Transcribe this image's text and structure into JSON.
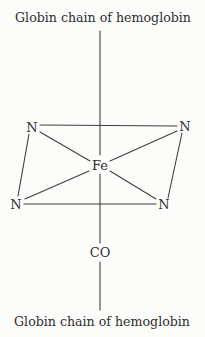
{
  "labels": {
    "top_chain": "Globin chain of hemoglobin",
    "bottom_chain": "Globin chain of hemoglobin"
  },
  "atoms": {
    "center_metal": "Fe",
    "ligand": "CO",
    "nitrogen_top_left": "N",
    "nitrogen_top_right": "N",
    "nitrogen_bottom_left": "N",
    "nitrogen_bottom_right": "N"
  },
  "colors": {
    "bond_line": "#3f3f3f",
    "text": "#2f2f2f",
    "background": "#fcfcfa"
  }
}
